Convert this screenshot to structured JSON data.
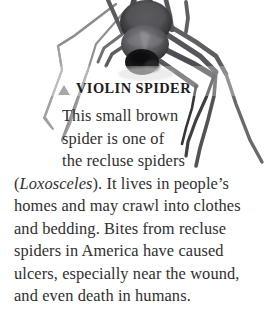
{
  "figure": {
    "photo": {
      "subject": "violin spider",
      "style": "black-and-white photograph",
      "alt": "Dark grey spider with long legs photographed from above on a white background"
    },
    "bullet_icon": "triangle-up-icon",
    "heading": "VIOLIN SPIDER",
    "body_text": "This small brown spider is one of the recluse spiders (Loxosceles). It lives in people's homes and may crawl into clothes and bedding. Bites from recluse spiders in America have caused ulcers, especially near the wound, and even death in humans.",
    "lines": [
      {
        "text": "This small brown",
        "indent": "wrap"
      },
      {
        "text": "spider is one of",
        "indent": "wrap"
      },
      {
        "text": "the recluse spiders",
        "indent": "wrap"
      },
      {
        "text": "(Loxosceles). It lives in people’s",
        "indent": "full",
        "italic_prefix": "Loxosceles"
      },
      {
        "text": "homes and may crawl into clothes",
        "indent": "full"
      },
      {
        "text": "and bedding. Bites from recluse",
        "indent": "full"
      },
      {
        "text": "spiders in America have caused",
        "indent": "full"
      },
      {
        "text": "ulcers, especially near the wound,",
        "indent": "full"
      },
      {
        "text": "and even death in humans.",
        "indent": "full"
      }
    ],
    "line_parts": {
      "loxosceles_open": "(",
      "loxosceles_genus": "Loxosceles",
      "loxosceles_rest": "). It lives in people’s"
    },
    "colors": {
      "background": "#ffffff",
      "body_text": "#2f2f30",
      "heading_text": "#1d1d1e",
      "bullet": "#a8a8a8",
      "photo_dark": "#3a3a3c",
      "photo_mid": "#6f6f72",
      "photo_light": "#a9a9ad"
    }
  }
}
